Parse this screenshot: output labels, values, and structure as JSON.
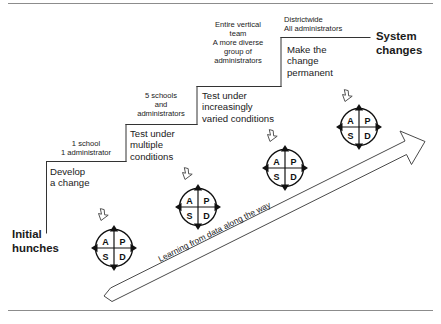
{
  "diagram": {
    "title_left": "Initial\nhunches",
    "title_right": "System\nchanges",
    "band_label": "Learning from data along the way",
    "steps": [
      {
        "scope": "1 school\n1 administrator",
        "action": "Develop\na change"
      },
      {
        "scope": "5 schools\nand\nadministrators",
        "action": "Test under\nmultiple\nconditions"
      },
      {
        "scope": "Entire vertical\nteam\nA more diverse\ngroup of\nadministrators",
        "action": "Test under\nincreasingly\nvaried conditions"
      },
      {
        "scope": "Districtwide\nAll administrators",
        "action": "Make the\nchange\npermanent"
      }
    ],
    "cycles": [
      {
        "plan": "P",
        "do": "D",
        "study": "S",
        "act": "A"
      },
      {
        "plan": "P",
        "do": "D",
        "study": "S",
        "act": "A"
      },
      {
        "plan": "P",
        "do": "D",
        "study": "S",
        "act": "A"
      },
      {
        "plan": "P",
        "do": "D",
        "study": "S",
        "act": "A"
      }
    ],
    "colors": {
      "ink": "#1a1a1a",
      "line": "#333333",
      "rule": "#8c8c8c",
      "background": "#ffffff"
    }
  }
}
